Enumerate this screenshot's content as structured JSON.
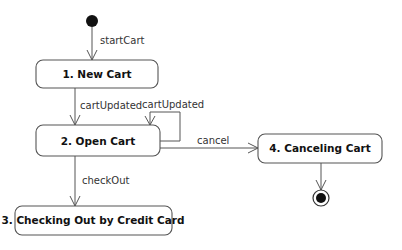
{
  "diagram": {
    "type": "UML state machine",
    "states": [
      {
        "id": "s1",
        "label": "1.  New Cart"
      },
      {
        "id": "s2",
        "label": "2.  Open Cart"
      },
      {
        "id": "s3",
        "label": "3.  Checking Out by Credit Card"
      },
      {
        "id": "s4",
        "label": "4.  Canceling Cart"
      }
    ],
    "transitions": [
      {
        "from": "initial",
        "to": "s1",
        "label": "startCart"
      },
      {
        "from": "s1",
        "to": "s2",
        "label": "cartUpdated"
      },
      {
        "from": "s2",
        "to": "s2",
        "label": "cartUpdated"
      },
      {
        "from": "s2",
        "to": "s4",
        "label": "cancel"
      },
      {
        "from": "s2",
        "to": "s3",
        "label": "checkOut"
      },
      {
        "from": "s4",
        "to": "final",
        "label": ""
      }
    ]
  }
}
